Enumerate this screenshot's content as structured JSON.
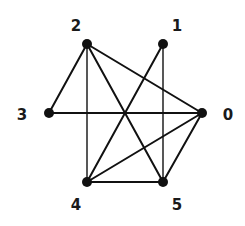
{
  "graph": {
    "nodes": [
      {
        "id": "0",
        "label": "0",
        "x": 202,
        "y": 113,
        "label_x": 228,
        "label_y": 115
      },
      {
        "id": "1",
        "label": "1",
        "x": 163,
        "y": 44,
        "label_x": 177,
        "label_y": 26
      },
      {
        "id": "2",
        "label": "2",
        "x": 87,
        "y": 44,
        "label_x": 76,
        "label_y": 26
      },
      {
        "id": "3",
        "label": "3",
        "x": 49,
        "y": 113,
        "label_x": 22,
        "label_y": 115
      },
      {
        "id": "4",
        "label": "4",
        "x": 87,
        "y": 182,
        "label_x": 76,
        "label_y": 205
      },
      {
        "id": "5",
        "label": "5",
        "x": 163,
        "y": 182,
        "label_x": 177,
        "label_y": 205
      }
    ],
    "edges": [
      {
        "from": "2",
        "to": "3"
      },
      {
        "from": "2",
        "to": "4"
      },
      {
        "from": "2",
        "to": "5"
      },
      {
        "from": "2",
        "to": "0"
      },
      {
        "from": "1",
        "to": "4"
      },
      {
        "from": "1",
        "to": "5"
      },
      {
        "from": "3",
        "to": "0"
      },
      {
        "from": "4",
        "to": "5"
      },
      {
        "from": "4",
        "to": "0"
      },
      {
        "from": "5",
        "to": "0"
      }
    ],
    "colors": {
      "edge": "#111111",
      "node": "#111111",
      "background": "#ffffff"
    }
  }
}
